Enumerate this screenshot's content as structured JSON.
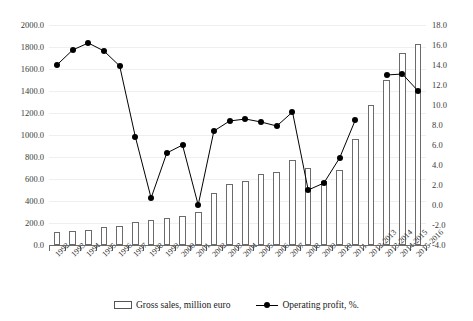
{
  "chart_data": {
    "type": "bar",
    "title": "",
    "subtitle": "",
    "xlabel": "",
    "ylabel": "",
    "y2label": "",
    "grid": true,
    "legend_position": "bottom",
    "categories": [
      "1992",
      "1993",
      "1994",
      "1995",
      "1996",
      "1997",
      "1998",
      "1999",
      "2000",
      "2001",
      "2002",
      "2003",
      "2004",
      "2005",
      "2006",
      "2007",
      "2008",
      "2009",
      "2010",
      "2011",
      "2012-2013",
      "2013-2014",
      "2014-2015",
      "2015-2016"
    ],
    "ylim": [
      0,
      2000
    ],
    "ytick_labels": [
      "2000.0",
      "1800.0",
      "1600.0",
      "1400.0",
      "1200.0",
      "1000.0",
      "800.0",
      "600.0",
      "400.0",
      "200.0",
      "0.0"
    ],
    "y2lim": [
      -4.0,
      18.0
    ],
    "y2tick_labels": [
      "18.0",
      "16.0",
      "14.0",
      "12.0",
      "10.0",
      "8.0",
      "6.0",
      "4.0",
      "2.0",
      "0.0",
      "-2.0",
      "-4.0"
    ],
    "series": [
      {
        "name": "Gross sales, million euro",
        "kind": "bar",
        "axis": "left",
        "values": [
          115,
          130,
          140,
          160,
          175,
          205,
          225,
          245,
          265,
          300,
          470,
          555,
          580,
          650,
          660,
          775,
          700,
          580,
          680,
          965,
          1270,
          1500,
          1745,
          1825
        ]
      },
      {
        "name": "Operating profit, %.",
        "kind": "line",
        "axis": "right",
        "values": [
          14.0,
          15.5,
          16.2,
          15.4,
          13.9,
          6.8,
          0.7,
          5.2,
          6.0,
          0.0,
          7.4,
          8.4,
          8.6,
          8.3,
          7.9,
          9.3,
          1.5,
          2.2,
          4.7,
          8.5,
          null,
          13.0,
          13.1,
          11.4
        ]
      }
    ]
  },
  "legend": {
    "items": [
      {
        "label": "Gross sales, million euro",
        "marker": "bar-swatch-icon"
      },
      {
        "label": "Operating profit, %.",
        "marker": "line-marker-icon"
      }
    ]
  },
  "colors": {
    "bar_fill": "#ffffff",
    "bar_stroke": "#6b6b6b",
    "line": "#000000",
    "marker": "#000000",
    "grid": "#efefef",
    "axis_text": "#3a3a3a"
  }
}
